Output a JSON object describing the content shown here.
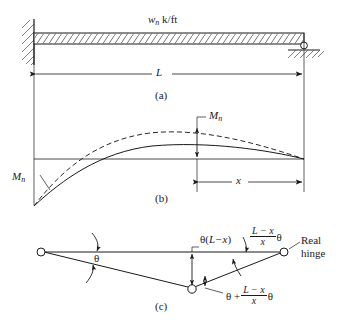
{
  "figure": {
    "ink_color": "#1a1a1a",
    "background": "#ffffff",
    "dash_color": "#3a3a3a"
  },
  "panel_a": {
    "tag": "(a)",
    "load_label_symbol": "w",
    "load_label_subscript": "n",
    "load_label_units": "k/ft",
    "span_label": "L",
    "left_support": "fixed-support",
    "right_support": "pin-support"
  },
  "panel_b": {
    "tag": "(b)",
    "left_moment_symbol": "M",
    "left_moment_subscript": "n",
    "mid_moment_symbol": "M",
    "mid_moment_subscript": "n",
    "distance_label": "x",
    "solid_curve_name": "nominal-moment-diagram",
    "dashed_curve_name": "required-moment-diagram"
  },
  "panel_c": {
    "tag": "(c)",
    "rotation_label": "θ",
    "deflection_label_theta": "θ(",
    "deflection_label_expr": "L−x",
    "deflection_label_close": ")",
    "right_rotation_num": "L − x",
    "right_rotation_den": "x",
    "right_rotation_theta": "θ",
    "hinge_rotation_lead": "θ +",
    "hinge_rotation_num": "L − x",
    "hinge_rotation_den": "x",
    "hinge_rotation_theta": "θ",
    "real_hinge_line1": "Real",
    "real_hinge_line2": "hinge"
  }
}
